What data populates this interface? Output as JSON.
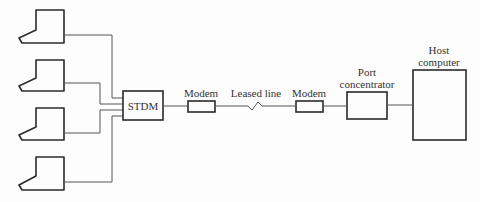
{
  "diagram": {
    "type": "network-topology",
    "terminals": [
      {
        "id": "terminal-1",
        "label": ""
      },
      {
        "id": "terminal-2",
        "label": ""
      },
      {
        "id": "terminal-3",
        "label": ""
      },
      {
        "id": "terminal-4",
        "label": ""
      }
    ],
    "nodes": {
      "stdm": {
        "label": "STDM"
      },
      "modem_left": {
        "label": "Modem"
      },
      "leased_line": {
        "label": "Leased line"
      },
      "modem_right": {
        "label": "Modem"
      },
      "port_concentrator": {
        "line1": "Port",
        "line2": "concentrator"
      },
      "host": {
        "line1": "Host",
        "line2": "computer"
      }
    },
    "edges": [
      [
        "terminal-1",
        "STDM"
      ],
      [
        "terminal-2",
        "STDM"
      ],
      [
        "terminal-3",
        "STDM"
      ],
      [
        "terminal-4",
        "STDM"
      ],
      [
        "STDM",
        "Modem"
      ],
      [
        "Modem",
        "Leased line"
      ],
      [
        "Leased line",
        "Modem"
      ],
      [
        "Modem",
        "Port concentrator"
      ],
      [
        "Port concentrator",
        "Host computer"
      ]
    ],
    "colors": {
      "stroke": "#2a2a2a",
      "wire": "#555555",
      "background": "#fdfdfd"
    }
  }
}
